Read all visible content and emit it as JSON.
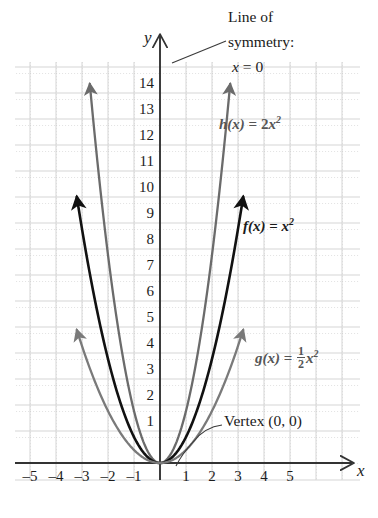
{
  "chart_data": {
    "type": "line",
    "title": "",
    "xlabel": "x",
    "ylabel": "y",
    "xlim": [
      -5.6,
      5.6
    ],
    "ylim": [
      -0.7,
      15.4
    ],
    "grid": true,
    "legend_position": "inline-annotations",
    "x_ticks": [
      "-5",
      "-4",
      "-3",
      "-2",
      "-1",
      "1",
      "2",
      "3",
      "4",
      "5"
    ],
    "y_ticks": [
      "1",
      "2",
      "3",
      "4",
      "5",
      "6",
      "7",
      "8",
      "9",
      "10",
      "11",
      "12",
      "13",
      "14"
    ],
    "series": [
      {
        "name": "h(x) = 2x^2",
        "label_html": "h(x) = 2x²",
        "coefficient": 2,
        "color": "#6b6b6b",
        "x": [
          -2.7,
          -2.4,
          -2.0,
          -1.6,
          -1.2,
          -0.8,
          -0.4,
          0,
          0.4,
          0.8,
          1.2,
          1.6,
          2.0,
          2.4,
          2.7
        ],
        "y": [
          14.58,
          11.52,
          8.0,
          5.12,
          2.88,
          1.28,
          0.32,
          0,
          0.32,
          1.28,
          2.88,
          5.12,
          8.0,
          11.52,
          14.58
        ]
      },
      {
        "name": "f(x) = x^2",
        "label_html": "f(x) = x²",
        "coefficient": 1,
        "color": "#111111",
        "x": [
          -3.2,
          -2.8,
          -2.4,
          -2.0,
          -1.6,
          -1.2,
          -0.8,
          -0.4,
          0,
          0.4,
          0.8,
          1.2,
          1.6,
          2.0,
          2.4,
          2.8,
          3.2
        ],
        "y": [
          10.24,
          7.84,
          5.76,
          4.0,
          2.56,
          1.44,
          0.64,
          0.16,
          0,
          0.16,
          0.64,
          1.44,
          2.56,
          4.0,
          5.76,
          7.84,
          10.24
        ]
      },
      {
        "name": "g(x) = (1/2)x^2",
        "label_html": "g(x) = ½x²",
        "coefficient": 0.5,
        "color": "#7a7a7a",
        "x": [
          -3.2,
          -2.8,
          -2.4,
          -2.0,
          -1.6,
          -1.2,
          -0.8,
          -0.4,
          0,
          0.4,
          0.8,
          1.2,
          1.6,
          2.0,
          2.4,
          2.8,
          3.2
        ],
        "y": [
          5.12,
          3.92,
          2.88,
          2.0,
          1.28,
          0.72,
          0.32,
          0.08,
          0,
          0.08,
          0.32,
          0.72,
          1.28,
          2.0,
          2.88,
          3.92,
          5.12
        ]
      }
    ],
    "annotations": [
      {
        "name": "line-of-symmetry",
        "text": "Line of symmetry:",
        "equation": "x = 0",
        "points_to": [
          0,
          14.6
        ]
      },
      {
        "name": "vertex",
        "text": "Vertex (0, 0)",
        "points_to": [
          0,
          0
        ]
      }
    ]
  },
  "axes": {
    "y_axis_label": "y",
    "x_axis_label": "x",
    "y_ticks": [
      "14",
      "13",
      "12",
      "11",
      "10",
      "9",
      "8",
      "7",
      "6",
      "5",
      "4",
      "3",
      "2",
      "1"
    ],
    "x_ticks_negative": [
      "–5",
      "–4",
      "–3",
      "–2",
      "–1"
    ],
    "x_ticks_positive": [
      "1",
      "2",
      "3",
      "4",
      "5"
    ]
  },
  "annotations": {
    "symmetry_line1": "Line of",
    "symmetry_line2": "symmetry:",
    "symmetry_equation_var": "x",
    "symmetry_equation_rest": " = 0",
    "vertex_text": "Vertex (0, 0)"
  },
  "function_labels": {
    "h": {
      "fn": "h",
      "arg": "(x)",
      "eq": " = 2",
      "var": "x",
      "exp": "2"
    },
    "f": {
      "fn": "f",
      "arg": "(x)",
      "eq": " = ",
      "var": "x",
      "exp": "2"
    },
    "g": {
      "fn": "g",
      "arg": "(x)",
      "eq": " = ",
      "num": "1",
      "den": "2",
      "var": "x",
      "exp": "2"
    }
  },
  "colors": {
    "curve_black": "#111111",
    "curve_gray_h": "#6b6b6b",
    "curve_gray_g": "#7a7a7a",
    "axis": "#333333",
    "grid_minor": "#c8c8c8",
    "grid_major": "#d8d8d8",
    "background": "#ffffff"
  }
}
